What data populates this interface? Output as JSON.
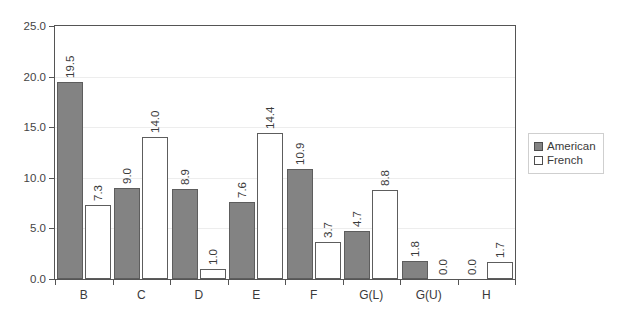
{
  "chart_data": {
    "type": "bar",
    "title": "",
    "xlabel": "",
    "ylabel": "",
    "ylim": [
      0.0,
      25.0
    ],
    "ytick_step": 5.0,
    "ytick_labels": [
      "0.0",
      "5.0",
      "10.0",
      "15.0",
      "20.0",
      "25.0"
    ],
    "ytick_values": [
      0.0,
      5.0,
      10.0,
      15.0,
      20.0,
      25.0
    ],
    "grid": true,
    "legend_position": "right-outside",
    "categories": [
      "B",
      "C",
      "D",
      "E",
      "F",
      "G(L)",
      "G(U)",
      "H"
    ],
    "series": [
      {
        "name": "American",
        "color": "#838383",
        "values": [
          19.5,
          9.0,
          8.9,
          7.6,
          10.9,
          4.7,
          1.8,
          0.0
        ],
        "labels": [
          "19.5",
          "9.0",
          "8.9",
          "7.6",
          "10.9",
          "4.7",
          "1.8",
          "0.0"
        ]
      },
      {
        "name": "French",
        "color": "#ffffff",
        "values": [
          7.3,
          14.0,
          1.0,
          14.4,
          3.7,
          8.8,
          0.0,
          1.7
        ],
        "labels": [
          "7.3",
          "14.0",
          "1.0",
          "14.4",
          "3.7",
          "8.8",
          "0.0",
          "1.7"
        ]
      }
    ]
  },
  "legend": {
    "items": [
      {
        "label": "American",
        "swatch": "filled-gray-swatch"
      },
      {
        "label": "French",
        "swatch": "outlined-white-swatch"
      }
    ]
  }
}
